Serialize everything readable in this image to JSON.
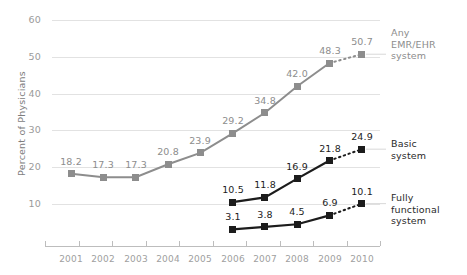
{
  "chart_data": {
    "type": "line",
    "title": "",
    "xlabel": "",
    "ylabel": "Percent of Physicians",
    "categories": [
      "2001",
      "2002",
      "2003",
      "2004",
      "2005",
      "2006",
      "2007",
      "2008",
      "2009",
      "2010"
    ],
    "ylim": [
      0,
      62
    ],
    "yticks": [
      10,
      20,
      30,
      40,
      50,
      60
    ],
    "ytick_labels": [
      "10",
      "20",
      "30",
      "40",
      "50",
      "60"
    ],
    "grid": true,
    "legend_position": "right",
    "series": [
      {
        "name": "Any EMR/EHR system",
        "legend_label_lines": [
          "Any",
          "EMR/EHR",
          "system"
        ],
        "color": "#8d8d8d",
        "x": [
          "2001",
          "2002",
          "2003",
          "2004",
          "2005",
          "2006",
          "2007",
          "2008",
          "2009",
          "2010"
        ],
        "values": [
          18.2,
          17.3,
          17.3,
          20.8,
          23.9,
          29.2,
          34.8,
          42.0,
          48.3,
          50.7
        ],
        "labels": [
          "18.2",
          "17.3",
          "17.3",
          "20.8",
          "23.9",
          "29.2",
          "34.8",
          "42.0",
          "48.3",
          "50.7"
        ],
        "dashed_from": "2009"
      },
      {
        "name": "Basic system",
        "legend_label_lines": [
          "Basic",
          "system"
        ],
        "color": "#1c1c1c",
        "x": [
          "2006",
          "2007",
          "2008",
          "2009",
          "2010"
        ],
        "values": [
          10.5,
          11.8,
          16.9,
          21.8,
          24.9
        ],
        "labels": [
          "10.5",
          "11.8",
          "16.9",
          "21.8",
          "24.9"
        ],
        "dashed_from": "2009"
      },
      {
        "name": "Fully functional system",
        "legend_label_lines": [
          "Fully",
          "functional",
          "system"
        ],
        "color": "#1c1c1c",
        "x": [
          "2006",
          "2007",
          "2008",
          "2009",
          "2010"
        ],
        "values": [
          3.1,
          3.8,
          4.5,
          6.9,
          10.1
        ],
        "labels": [
          "3.1",
          "3.8",
          "4.5",
          "6.9",
          "10.1"
        ],
        "dashed_from": "2009"
      }
    ]
  },
  "legend": {
    "any_emr": {
      "l0": "Any",
      "l1": "EMR/EHR",
      "l2": "system"
    },
    "basic": {
      "l0": "Basic",
      "l1": "system"
    },
    "fully": {
      "l0": "Fully",
      "l1": "functional",
      "l2": "system"
    }
  },
  "axis": {
    "ylabel": "Percent of Physicians",
    "y": {
      "t0": "10",
      "t1": "20",
      "t2": "30",
      "t3": "40",
      "t4": "50",
      "t5": "60"
    },
    "x": {
      "t0": "2001",
      "t1": "2002",
      "t2": "2003",
      "t3": "2004",
      "t4": "2005",
      "t5": "2006",
      "t6": "2007",
      "t7": "2008",
      "t8": "2009",
      "t9": "2010"
    }
  }
}
